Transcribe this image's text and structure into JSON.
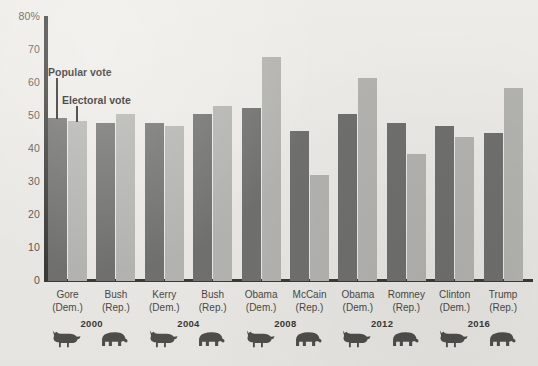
{
  "chart_data": {
    "type": "bar",
    "title": "",
    "xlabel": "",
    "ylabel": "",
    "ylim": [
      0,
      80
    ],
    "yticks": [
      0,
      10,
      20,
      30,
      40,
      50,
      60,
      70,
      80
    ],
    "ytick_labels": [
      "0",
      "10",
      "20",
      "30",
      "40",
      "50",
      "60",
      "70",
      "80%"
    ],
    "grid": false,
    "legend_position": "in-plot-annotations",
    "categories": [
      "Gore (Dem.)",
      "Bush (Rep.)",
      "Kerry (Dem.)",
      "Bush (Rep.)",
      "Obama (Dem.)",
      "McCain (Rep.)",
      "Obama (Dem.)",
      "Romney (Rep.)",
      "Clinton (Dem.)",
      "Trump (Rep.)"
    ],
    "series": [
      {
        "name": "Popular vote",
        "color": "#6f6f6d",
        "values": [
          49.5,
          48.0,
          47.8,
          50.5,
          52.5,
          45.5,
          50.5,
          48.0,
          47.0,
          45.0
        ]
      },
      {
        "name": "Electoral vote",
        "color": "#b2b2ae",
        "values": [
          48.5,
          50.5,
          47.0,
          53.0,
          67.8,
          32.0,
          61.5,
          38.5,
          43.5,
          58.5
        ]
      }
    ],
    "annotations": [
      {
        "text": "Popular vote",
        "series": "Popular vote"
      },
      {
        "text": "Electoral vote",
        "series": "Electoral vote"
      }
    ]
  },
  "axis": {
    "y_labels": [
      "80%",
      "70",
      "60",
      "50",
      "40",
      "30",
      "20",
      "10",
      "0"
    ]
  },
  "candidates": [
    {
      "name": "Gore",
      "party": "(Dem.)",
      "party_key": "dem",
      "mascot": "donkey-icon",
      "popular": 49.5,
      "electoral": 48.5
    },
    {
      "name": "Bush",
      "party": "(Rep.)",
      "party_key": "rep",
      "mascot": "elephant-icon",
      "popular": 48.0,
      "electoral": 50.5
    },
    {
      "name": "Kerry",
      "party": "(Dem.)",
      "party_key": "dem",
      "mascot": "donkey-icon",
      "popular": 47.8,
      "electoral": 47.0
    },
    {
      "name": "Bush",
      "party": "(Rep.)",
      "party_key": "rep",
      "mascot": "elephant-icon",
      "popular": 50.5,
      "electoral": 53.0
    },
    {
      "name": "Obama",
      "party": "(Dem.)",
      "party_key": "dem",
      "mascot": "donkey-icon",
      "popular": 52.5,
      "electoral": 67.8
    },
    {
      "name": "McCain",
      "party": "(Rep.)",
      "party_key": "rep",
      "mascot": "elephant-icon",
      "popular": 45.5,
      "electoral": 32.0
    },
    {
      "name": "Obama",
      "party": "(Dem.)",
      "party_key": "dem",
      "mascot": "donkey-icon",
      "popular": 50.5,
      "electoral": 61.5
    },
    {
      "name": "Romney",
      "party": "(Rep.)",
      "party_key": "rep",
      "mascot": "elephant-icon",
      "popular": 48.0,
      "electoral": 38.5
    },
    {
      "name": "Clinton",
      "party": "(Dem.)",
      "party_key": "dem",
      "mascot": "donkey-icon",
      "popular": 47.0,
      "electoral": 43.5
    },
    {
      "name": "Trump",
      "party": "(Rep.)",
      "party_key": "rep",
      "mascot": "elephant-icon",
      "popular": 45.0,
      "electoral": 58.5
    }
  ],
  "elections": [
    {
      "year": "2000"
    },
    {
      "year": "2004"
    },
    {
      "year": "2008"
    },
    {
      "year": "2012"
    },
    {
      "year": "2016"
    }
  ],
  "annotations": {
    "popular": "Popular vote",
    "electoral": "Electoral vote"
  },
  "colors": {
    "popular_bar": "#6f6f6d",
    "electoral_bar": "#b2b2ae",
    "axis": "#3a3a38",
    "background": "#eceae6",
    "text": "#4a4845"
  }
}
